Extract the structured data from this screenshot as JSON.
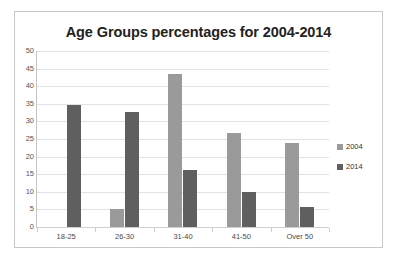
{
  "chart_data": {
    "type": "bar",
    "title": "Age Groups percentages for 2004-2014",
    "xlabel": "",
    "ylabel": "",
    "ylim": [
      0,
      50
    ],
    "ytick_step": 5,
    "yticks": [
      50,
      45,
      40,
      35,
      30,
      25,
      20,
      15,
      10,
      5,
      0
    ],
    "grid": true,
    "legend_position": "right",
    "categories": [
      "18-25",
      "26-30",
      "31-40",
      "41-50",
      "Over 50"
    ],
    "series": [
      {
        "name": "2004",
        "color": "#9a9a9a",
        "values": [
          0,
          5.2,
          43.5,
          26.8,
          24.0
        ]
      },
      {
        "name": "2014",
        "color": "#5f5f5f",
        "values": [
          34.7,
          32.8,
          16.2,
          9.9,
          5.6
        ]
      }
    ]
  },
  "legend": {
    "items": [
      {
        "label": "2004",
        "color": "#9a9a9a"
      },
      {
        "label": "2014",
        "color": "#5f5f5f"
      }
    ]
  }
}
